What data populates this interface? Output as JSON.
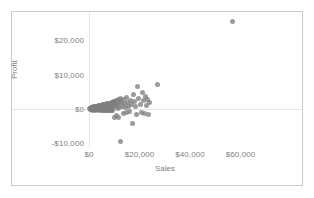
{
  "chart_data": {
    "type": "scatter",
    "title": "",
    "xlabel": "Sales",
    "ylabel": "Profit",
    "xlim": [
      -6000,
      68000
    ],
    "ylim": [
      -14000,
      29000
    ],
    "grid": true,
    "gridlines": {
      "x": [
        0
      ],
      "y": [
        0
      ]
    },
    "legend": null,
    "marker": {
      "color": "#7f7f7f",
      "size": 5,
      "opacity": 0.78,
      "shape": "circle"
    },
    "xticks": [
      0,
      20000,
      40000,
      60000
    ],
    "xticklabels": [
      "$0",
      "$20,000",
      "$40,000",
      "$60,000"
    ],
    "yticks": [
      -10000,
      0,
      10000,
      20000
    ],
    "yticklabels": [
      "-$10,000",
      "$0",
      "$10,000",
      "$20,000"
    ],
    "points": [
      [
        300,
        120
      ],
      [
        450,
        -60
      ],
      [
        620,
        240
      ],
      [
        700,
        90
      ],
      [
        820,
        -180
      ],
      [
        900,
        320
      ],
      [
        980,
        60
      ],
      [
        1100,
        -220
      ],
      [
        1180,
        420
      ],
      [
        1250,
        150
      ],
      [
        1320,
        -90
      ],
      [
        1400,
        560
      ],
      [
        1480,
        210
      ],
      [
        1560,
        -310
      ],
      [
        1640,
        80
      ],
      [
        1720,
        640
      ],
      [
        1800,
        330
      ],
      [
        1880,
        -150
      ],
      [
        1960,
        470
      ],
      [
        2040,
        120
      ],
      [
        2140,
        -260
      ],
      [
        2220,
        700
      ],
      [
        2300,
        250
      ],
      [
        2380,
        -70
      ],
      [
        2460,
        520
      ],
      [
        2540,
        160
      ],
      [
        2620,
        -330
      ],
      [
        2700,
        780
      ],
      [
        2790,
        300
      ],
      [
        2870,
        -110
      ],
      [
        2950,
        600
      ],
      [
        3030,
        190
      ],
      [
        3120,
        -240
      ],
      [
        3200,
        860
      ],
      [
        3280,
        360
      ],
      [
        3360,
        -50
      ],
      [
        3440,
        680
      ],
      [
        3520,
        230
      ],
      [
        3610,
        -290
      ],
      [
        3690,
        940
      ],
      [
        3770,
        410
      ],
      [
        3850,
        -130
      ],
      [
        3930,
        740
      ],
      [
        4010,
        270
      ],
      [
        4100,
        -350
      ],
      [
        4180,
        1020
      ],
      [
        4260,
        450
      ],
      [
        4340,
        -20
      ],
      [
        4420,
        800
      ],
      [
        4500,
        310
      ],
      [
        4590,
        -270
      ],
      [
        4670,
        1100
      ],
      [
        4750,
        490
      ],
      [
        4830,
        -160
      ],
      [
        4910,
        880
      ],
      [
        5000,
        340
      ],
      [
        5080,
        -380
      ],
      [
        5160,
        1180
      ],
      [
        5240,
        530
      ],
      [
        5320,
        -90
      ],
      [
        5400,
        960
      ],
      [
        5490,
        380
      ],
      [
        5570,
        -300
      ],
      [
        5650,
        1260
      ],
      [
        5730,
        570
      ],
      [
        5810,
        -200
      ],
      [
        5890,
        1040
      ],
      [
        5980,
        420
      ],
      [
        6060,
        -420
      ],
      [
        6140,
        1340
      ],
      [
        6220,
        610
      ],
      [
        6300,
        -120
      ],
      [
        6380,
        1120
      ],
      [
        6470,
        460
      ],
      [
        6550,
        -340
      ],
      [
        6630,
        1420
      ],
      [
        6710,
        650
      ],
      [
        6790,
        -230
      ],
      [
        6870,
        1200
      ],
      [
        6960,
        500
      ],
      [
        7040,
        -460
      ],
      [
        7120,
        1500
      ],
      [
        7200,
        690
      ],
      [
        7280,
        -150
      ],
      [
        7360,
        1280
      ],
      [
        7450,
        540
      ],
      [
        7530,
        -380
      ],
      [
        7610,
        1580
      ],
      [
        7690,
        730
      ],
      [
        7770,
        -260
      ],
      [
        7850,
        1360
      ],
      [
        7940,
        580
      ],
      [
        8020,
        -500
      ],
      [
        8100,
        1660
      ],
      [
        8180,
        770
      ],
      [
        8260,
        -180
      ],
      [
        8340,
        1440
      ],
      [
        8430,
        620
      ],
      [
        8510,
        -420
      ],
      [
        8590,
        1740
      ],
      [
        8670,
        810
      ],
      [
        8750,
        -290
      ],
      [
        8830,
        1520
      ],
      [
        8920,
        660
      ],
      [
        9000,
        -540
      ],
      [
        9100,
        1820
      ],
      [
        9200,
        1950
      ],
      [
        9300,
        850
      ],
      [
        9400,
        -320
      ],
      [
        9500,
        1600
      ],
      [
        9650,
        2100
      ],
      [
        9800,
        700
      ],
      [
        9950,
        -2400
      ],
      [
        10100,
        2300
      ],
      [
        10300,
        1680
      ],
      [
        10500,
        900
      ],
      [
        10700,
        -1900
      ],
      [
        10900,
        2450
      ],
      [
        11100,
        1350
      ],
      [
        11300,
        260
      ],
      [
        11500,
        -2600
      ],
      [
        11700,
        2750
      ],
      [
        11900,
        1760
      ],
      [
        12100,
        480
      ],
      [
        12300,
        -9600
      ],
      [
        12600,
        3100
      ],
      [
        12900,
        1900
      ],
      [
        13200,
        620
      ],
      [
        13500,
        -1400
      ],
      [
        13800,
        2900
      ],
      [
        14100,
        1550
      ],
      [
        14400,
        340
      ],
      [
        14700,
        -1100
      ],
      [
        15000,
        3400
      ],
      [
        15400,
        2000
      ],
      [
        15800,
        760
      ],
      [
        16200,
        -800
      ],
      [
        16600,
        2600
      ],
      [
        17000,
        1200
      ],
      [
        17400,
        -4300
      ],
      [
        17800,
        4200
      ],
      [
        18200,
        2200
      ],
      [
        18600,
        850
      ],
      [
        19000,
        -1700
      ],
      [
        19400,
        6500
      ],
      [
        19800,
        3000
      ],
      [
        20200,
        1400
      ],
      [
        20600,
        -900
      ],
      [
        21000,
        4800
      ],
      [
        21400,
        2400
      ],
      [
        21800,
        -1200
      ],
      [
        22200,
        3600
      ],
      [
        22600,
        1000
      ],
      [
        23000,
        2800
      ],
      [
        23500,
        -1500
      ],
      [
        24000,
        1800
      ],
      [
        27000,
        7200
      ],
      [
        57000,
        25600
      ]
    ]
  },
  "axes": {
    "x_title": "Sales",
    "y_title": "Profit"
  }
}
